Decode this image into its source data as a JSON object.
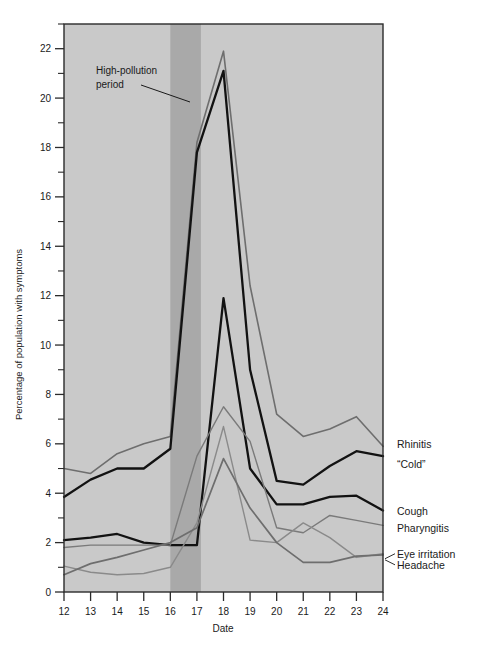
{
  "chart_data": {
    "type": "line",
    "title": "",
    "xlabel": "Date",
    "ylabel": "Percentage of population with symptoms",
    "xlim": [
      12,
      24
    ],
    "ylim": [
      0,
      23
    ],
    "x": [
      12,
      13,
      14,
      15,
      16,
      17,
      18,
      19,
      20,
      21,
      22,
      23,
      24
    ],
    "xticks": [
      "12",
      "13",
      "14",
      "15",
      "16",
      "17",
      "18",
      "19",
      "20",
      "21",
      "22",
      "23",
      "24"
    ],
    "yticks": [
      "0",
      "2",
      "4",
      "6",
      "8",
      "10",
      "12",
      "14",
      "16",
      "18",
      "20",
      "22"
    ],
    "ytick_minor_step": 1,
    "grid": false,
    "legend": "right-inline-labels",
    "series": [
      {
        "name": "Rhinitis",
        "label": "Rhinitis",
        "color": "#6e6e6e",
        "width": 1.6,
        "values": [
          5.0,
          4.8,
          5.6,
          6.0,
          6.3,
          18.2,
          21.9,
          12.4,
          7.2,
          6.3,
          6.6,
          7.1,
          5.9
        ],
        "label_y": 6.0
      },
      {
        "name": "Cold",
        "label": "“Cold”",
        "color": "#121212",
        "width": 2.3,
        "values": [
          3.85,
          4.55,
          5.0,
          5.0,
          5.8,
          17.8,
          21.1,
          9.0,
          4.5,
          4.35,
          5.1,
          5.7,
          5.5
        ],
        "label_y": 5.2
      },
      {
        "name": "Cough",
        "label": "Cough",
        "color": "#121212",
        "width": 2.3,
        "values": [
          2.1,
          2.2,
          2.35,
          2.0,
          1.9,
          1.9,
          11.9,
          5.0,
          3.55,
          3.55,
          3.85,
          3.9,
          3.3
        ],
        "label_y": 3.3
      },
      {
        "name": "Pharyngitis",
        "label": "Pharyngitis",
        "color": "#7a7a7a",
        "width": 1.4,
        "values": [
          1.8,
          1.9,
          1.9,
          1.9,
          1.9,
          5.5,
          7.5,
          6.1,
          2.6,
          2.4,
          3.1,
          2.9,
          2.7
        ],
        "label_y": 2.6
      },
      {
        "name": "Eye irritation",
        "label": "Eye irritation",
        "color": "#8a8a8a",
        "width": 1.4,
        "values": [
          1.05,
          0.8,
          0.7,
          0.75,
          1.0,
          2.8,
          6.7,
          2.1,
          2.0,
          2.8,
          2.2,
          1.4,
          1.55
        ],
        "label_y": 1.55
      },
      {
        "name": "Headache",
        "label": "Headache",
        "color": "#6e6e6e",
        "width": 1.7,
        "values": [
          0.7,
          1.15,
          1.4,
          1.7,
          2.0,
          2.6,
          5.4,
          3.4,
          2.0,
          1.2,
          1.2,
          1.45,
          1.5
        ],
        "label_y": 1.1
      }
    ],
    "bands": [
      {
        "name": "plot-background",
        "from": 12,
        "to": 24,
        "color": "#c9c9c9"
      },
      {
        "name": "high-pollution-period",
        "from": 16.0,
        "to": 17.15,
        "color": "#a9a9a9"
      }
    ],
    "annotations": [
      {
        "name": "high-pollution-annotation",
        "line1": "High-pollution",
        "line2": "period",
        "x": 0.0,
        "y": 0.0
      }
    ]
  },
  "colors": {
    "plot_bg": "#c9c9c9",
    "band": "#a9a9a9",
    "frame": "#2b2b2b",
    "page_bg": "#ffffff",
    "text": "#1a1a1a"
  }
}
